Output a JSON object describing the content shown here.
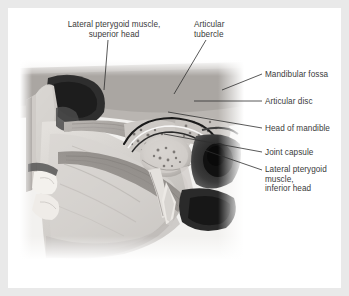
{
  "figure": {
    "type": "anatomical-illustration",
    "modality": "grayscale anatomical photograph",
    "background_color": "#e9e9e9",
    "card_color": "#ffffff",
    "label_color": "#3b3b3b",
    "leader_color": "#2f2f2f"
  },
  "labels": {
    "lateral_pterygoid_superior": "Lateral pterygoid muscle,\nsuperior head",
    "articular_tubercle": "Articular\ntubercle",
    "mandibular_fossa": "Mandibular fossa",
    "articular_disc": "Articular disc",
    "head_of_mandible": "Head of mandible",
    "joint_capsule": "Joint capsule",
    "lateral_pterygoid_inferior": "Lateral pterygoid\nmuscle,\ninferior head"
  }
}
